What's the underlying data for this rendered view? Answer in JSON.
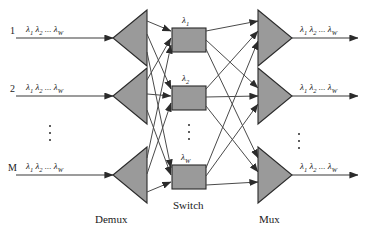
{
  "figure": {
    "colors": {
      "shape_fill": "#9a9a9a",
      "shape_stroke": "#2b2b2b",
      "line": "#444444",
      "text": "#1a1a1a",
      "background": "#ffffff"
    }
  },
  "inputs": [
    {
      "index": "1",
      "wavelengths": "λ₁ λ₂ ... λW"
    },
    {
      "index": "2",
      "wavelengths": "λ₁ λ₂ ... λW"
    },
    {
      "index": "M",
      "wavelengths": "λ₁ λ₂ ... λW"
    }
  ],
  "outputs": [
    {
      "wavelengths": "λ₁ λ₂ ... λW"
    },
    {
      "wavelengths": "λ₁ λ₂ ... λW"
    },
    {
      "wavelengths": "λ₁ λ₂ ... λW"
    }
  ],
  "lambda_parts": {
    "lam": "λ",
    "one": "1",
    "two": "2",
    "dots": "...",
    "w": "W"
  },
  "switch_blocks": [
    {
      "label_base": "λ",
      "label_sub": "1"
    },
    {
      "label_base": "λ",
      "label_sub": "2"
    },
    {
      "label_base": "λ",
      "label_sub": "W"
    }
  ],
  "stage_labels": {
    "demux": "Demux",
    "switch": "Switch",
    "mux": "Mux"
  },
  "ellipses": {
    "input_vertical": "⋮",
    "switch_vertical": "⋮",
    "output_vertical": "⋮"
  }
}
